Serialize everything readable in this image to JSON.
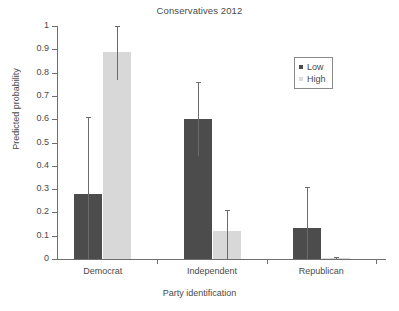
{
  "chart_data": {
    "type": "bar",
    "title": "Conservatives 2012",
    "xlabel": "Party identification",
    "ylabel": "Predicted probability",
    "ylim": [
      0,
      1
    ],
    "ytick_labels": [
      "0",
      "0.1",
      "0.2",
      "0.3",
      "0.4",
      "0.5",
      "0.6",
      "0.7",
      "0.8",
      "0.9",
      "1"
    ],
    "ytick_values": [
      0,
      0.1,
      0.2,
      0.3,
      0.4,
      0.5,
      0.6,
      0.7,
      0.8,
      0.9,
      1
    ],
    "categories": [
      "Democrat",
      "Independent",
      "Republican"
    ],
    "grid": false,
    "legend_position": "upper right",
    "legend": [
      "Low",
      "High"
    ],
    "series": [
      {
        "name": "Low",
        "color": "#4c4c4c",
        "values": [
          0.28,
          0.6,
          0.135
        ],
        "err_low": [
          0.0,
          0.44,
          0.0
        ],
        "err_high": [
          0.61,
          0.76,
          0.31
        ]
      },
      {
        "name": "High",
        "color": "#d8d8d8",
        "values": [
          0.89,
          0.12,
          0.005
        ],
        "err_low": [
          0.77,
          0.0,
          0.0
        ],
        "err_high": [
          1.0,
          0.21,
          0.01
        ]
      }
    ]
  },
  "legend": {
    "items": [
      {
        "label": "Low",
        "swatch": "low"
      },
      {
        "label": "High",
        "swatch": "high"
      }
    ]
  }
}
